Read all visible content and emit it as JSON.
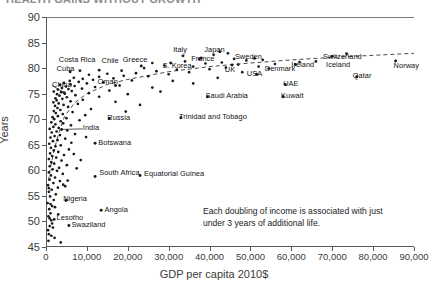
{
  "title": "HEALTH GAINS WITHOUT GROWTH",
  "annotation": "Each doubling of income is associated with just under 3 years of additional life.",
  "axes": {
    "y_title": "Years",
    "x_title": "GDP per capita 2010$",
    "y_ticks": [
      "45",
      "50",
      "55",
      "60",
      "65",
      "70",
      "75",
      "80",
      "85",
      "90"
    ],
    "x_ticks": [
      "0",
      "10,000",
      "20,000",
      "30,000",
      "40,000",
      "50,000",
      "60,000",
      "70,000",
      "80,000",
      "90,000"
    ]
  },
  "chart_data": {
    "type": "scatter",
    "title": "HEALTH GAINS WITHOUT GROWTH",
    "xlabel": "GDP per capita 2010$",
    "ylabel": "Years",
    "xlim": [
      0,
      90000
    ],
    "ylim": [
      45,
      90
    ],
    "x_tick_step": 10000,
    "y_tick_step": 5,
    "grid": false,
    "legend": false,
    "trendline": {
      "type": "logarithmic",
      "style": "dashed",
      "color": "#333333",
      "note": "Each doubling of income is associated with just under 3 years of additional life.",
      "points": [
        [
          600,
          58.0
        ],
        [
          1200,
          61.0
        ],
        [
          2000,
          64.0
        ],
        [
          3000,
          67.0
        ],
        [
          4500,
          70.5
        ],
        [
          7000,
          73.2
        ],
        [
          10000,
          75.0
        ],
        [
          15000,
          76.8
        ],
        [
          20000,
          77.8
        ],
        [
          30000,
          79.3
        ],
        [
          40000,
          80.3
        ],
        [
          50000,
          81.0
        ],
        [
          60000,
          81.6
        ],
        [
          70000,
          82.1
        ],
        [
          80000,
          82.5
        ],
        [
          90000,
          82.9
        ]
      ]
    },
    "labeled_points": [
      {
        "name": "China",
        "x": 4400,
        "y": 75.2,
        "label_x": 1500,
        "label_y": 76.6,
        "anchor": "left",
        "leader": true
      },
      {
        "name": "Cuba",
        "x": 5900,
        "y": 79.3,
        "label_x": 2600,
        "label_y": 79.6,
        "anchor": "left"
      },
      {
        "name": "Costa Rica",
        "x": 8300,
        "y": 79.5,
        "label_x": 7600,
        "label_y": 81.4,
        "anchor": "center"
      },
      {
        "name": "Chile",
        "x": 13000,
        "y": 79.6,
        "label_x": 13600,
        "label_y": 81.3,
        "anchor": "left"
      },
      {
        "name": "Oman",
        "x": 17000,
        "y": 76.6,
        "label_x": 12600,
        "label_y": 77.0,
        "anchor": "left"
      },
      {
        "name": "Greece",
        "x": 23300,
        "y": 80.4,
        "label_x": 21800,
        "label_y": 81.4,
        "anchor": "center"
      },
      {
        "name": "S. Korea",
        "x": 30500,
        "y": 81.0,
        "label_x": 28500,
        "label_y": 80.2,
        "anchor": "left"
      },
      {
        "name": "Italy",
        "x": 33500,
        "y": 82.4,
        "label_x": 32800,
        "label_y": 83.4,
        "anchor": "center"
      },
      {
        "name": "France",
        "x": 37500,
        "y": 81.8,
        "label_x": 35500,
        "label_y": 81.6,
        "anchor": "left"
      },
      {
        "name": "Japan",
        "x": 42500,
        "y": 83.2,
        "label_x": 41200,
        "label_y": 83.4,
        "anchor": "center"
      },
      {
        "name": "UK",
        "x": 45500,
        "y": 80.6,
        "label_x": 45000,
        "label_y": 79.5,
        "anchor": "center"
      },
      {
        "name": "Sweden",
        "x": 51000,
        "y": 81.9,
        "label_x": 49500,
        "label_y": 81.9,
        "anchor": "center"
      },
      {
        "name": "Denmark",
        "x": 54500,
        "y": 79.9,
        "label_x": 53500,
        "label_y": 79.7,
        "anchor": "left"
      },
      {
        "name": "USA",
        "x": 51500,
        "y": 78.8,
        "label_x": 51000,
        "label_y": 78.6,
        "anchor": "center"
      },
      {
        "name": "Ireland",
        "x": 61000,
        "y": 80.7,
        "label_x": 60000,
        "label_y": 80.5,
        "anchor": "left"
      },
      {
        "name": "Switzerland",
        "x": 73500,
        "y": 82.8,
        "label_x": 72500,
        "label_y": 81.9,
        "anchor": "center"
      },
      {
        "name": "Iceland",
        "x": 70000,
        "y": 82.3,
        "label_x": 68500,
        "label_y": 80.5,
        "anchor": "left"
      },
      {
        "name": "Norway",
        "x": 85500,
        "y": 81.4,
        "label_x": 85000,
        "label_y": 80.3,
        "anchor": "left"
      },
      {
        "name": "Qatar",
        "x": 76000,
        "y": 78.3,
        "label_x": 75000,
        "label_y": 78.2,
        "anchor": "left"
      },
      {
        "name": "UAE",
        "x": 58500,
        "y": 76.8,
        "label_x": 58000,
        "label_y": 76.7,
        "anchor": "left"
      },
      {
        "name": "Kuwait",
        "x": 58000,
        "y": 74.4,
        "label_x": 57500,
        "label_y": 74.3,
        "anchor": "left"
      },
      {
        "name": "Saudi Arabia",
        "x": 39500,
        "y": 74.4,
        "label_x": 39000,
        "label_y": 74.3,
        "anchor": "left"
      },
      {
        "name": "Trinidad and Tobago",
        "x": 33000,
        "y": 70.3,
        "label_x": 32500,
        "label_y": 70.2,
        "anchor": "left"
      },
      {
        "name": "Russia",
        "x": 15500,
        "y": 70.1,
        "label_x": 15000,
        "label_y": 70.0,
        "anchor": "left"
      },
      {
        "name": "India",
        "x": 3800,
        "y": 68.0,
        "label_x": 9000,
        "label_y": 68.1,
        "anchor": "left",
        "leader": true
      },
      {
        "name": "Botswana",
        "x": 12000,
        "y": 65.3,
        "label_x": 12800,
        "label_y": 65.2,
        "anchor": "left"
      },
      {
        "name": "South Africa",
        "x": 12000,
        "y": 58.8,
        "label_x": 13000,
        "label_y": 59.2,
        "anchor": "left"
      },
      {
        "name": "Equatorial Guinea",
        "x": 23000,
        "y": 59.0,
        "label_x": 24000,
        "label_y": 59.0,
        "anchor": "left"
      },
      {
        "name": "Nigeria",
        "x": 4900,
        "y": 54.1,
        "label_x": 4200,
        "label_y": 54.3,
        "anchor": "left"
      },
      {
        "name": "Angola",
        "x": 13500,
        "y": 52.2,
        "label_x": 14300,
        "label_y": 52.1,
        "anchor": "left"
      },
      {
        "name": "Lesotho",
        "x": 2000,
        "y": 50.4,
        "label_x": 2600,
        "label_y": 50.4,
        "anchor": "left"
      },
      {
        "name": "Swaziland",
        "x": 5600,
        "y": 49.2,
        "label_x": 6200,
        "label_y": 49.2,
        "anchor": "left"
      }
    ],
    "unlabeled_points": [
      [
        700,
        47.5
      ],
      [
        500,
        48.3
      ],
      [
        900,
        49.1
      ],
      [
        1300,
        50.2
      ],
      [
        600,
        51.0
      ],
      [
        1100,
        51.6
      ],
      [
        800,
        52.4
      ],
      [
        1500,
        53.0
      ],
      [
        400,
        53.6
      ],
      [
        1900,
        54.2
      ],
      [
        1000,
        54.9
      ],
      [
        2400,
        55.3
      ],
      [
        700,
        55.8
      ],
      [
        1400,
        56.2
      ],
      [
        2900,
        56.6
      ],
      [
        500,
        57.1
      ],
      [
        1800,
        57.5
      ],
      [
        3400,
        57.9
      ],
      [
        900,
        58.2
      ],
      [
        2200,
        58.6
      ],
      [
        1200,
        59.0
      ],
      [
        4100,
        59.3
      ],
      [
        700,
        59.6
      ],
      [
        2700,
        59.9
      ],
      [
        1600,
        60.2
      ],
      [
        3200,
        60.5
      ],
      [
        900,
        60.8
      ],
      [
        5100,
        61.0
      ],
      [
        2000,
        61.3
      ],
      [
        1300,
        61.6
      ],
      [
        3800,
        61.9
      ],
      [
        700,
        62.2
      ],
      [
        2500,
        62.5
      ],
      [
        1500,
        62.8
      ],
      [
        4400,
        63.0
      ],
      [
        1000,
        63.3
      ],
      [
        3000,
        63.6
      ],
      [
        1900,
        63.9
      ],
      [
        5600,
        64.1
      ],
      [
        1200,
        64.4
      ],
      [
        2300,
        64.7
      ],
      [
        3600,
        64.9
      ],
      [
        800,
        65.2
      ],
      [
        6200,
        65.4
      ],
      [
        1700,
        65.7
      ],
      [
        2800,
        65.9
      ],
      [
        4700,
        66.2
      ],
      [
        1100,
        66.4
      ],
      [
        2100,
        66.7
      ],
      [
        3400,
        66.9
      ],
      [
        7100,
        67.1
      ],
      [
        1400,
        67.4
      ],
      [
        2600,
        67.6
      ],
      [
        5200,
        67.8
      ],
      [
        900,
        68.1
      ],
      [
        3100,
        68.3
      ],
      [
        1800,
        68.5
      ],
      [
        6100,
        68.8
      ],
      [
        2300,
        69.0
      ],
      [
        4200,
        69.2
      ],
      [
        1300,
        69.4
      ],
      [
        3600,
        69.6
      ],
      [
        8200,
        69.8
      ],
      [
        2000,
        70.0
      ],
      [
        5000,
        70.2
      ],
      [
        1600,
        70.4
      ],
      [
        2900,
        70.6
      ],
      [
        9600,
        70.8
      ],
      [
        4100,
        71.0
      ],
      [
        2400,
        71.2
      ],
      [
        6500,
        71.4
      ],
      [
        1900,
        71.6
      ],
      [
        3500,
        71.8
      ],
      [
        11000,
        72.0
      ],
      [
        2800,
        72.2
      ],
      [
        5400,
        72.4
      ],
      [
        2200,
        72.6
      ],
      [
        4300,
        72.8
      ],
      [
        7800,
        73.0
      ],
      [
        3100,
        73.1
      ],
      [
        1800,
        73.3
      ],
      [
        6000,
        73.5
      ],
      [
        2600,
        73.7
      ],
      [
        9000,
        73.8
      ],
      [
        4000,
        74.0
      ],
      [
        2300,
        74.1
      ],
      [
        5100,
        74.3
      ],
      [
        13000,
        74.4
      ],
      [
        3300,
        74.6
      ],
      [
        7200,
        74.7
      ],
      [
        2700,
        74.9
      ],
      [
        4600,
        75.0
      ],
      [
        10500,
        75.1
      ],
      [
        3700,
        75.3
      ],
      [
        1900,
        75.4
      ],
      [
        6300,
        75.5
      ],
      [
        15500,
        75.6
      ],
      [
        2900,
        75.8
      ],
      [
        5500,
        75.9
      ],
      [
        8800,
        76.0
      ],
      [
        3900,
        76.1
      ],
      [
        12000,
        76.3
      ],
      [
        4900,
        76.4
      ],
      [
        7000,
        76.5
      ],
      [
        18000,
        76.6
      ],
      [
        3400,
        76.7
      ],
      [
        6000,
        76.8
      ],
      [
        10000,
        77.0
      ],
      [
        4400,
        77.1
      ],
      [
        14000,
        77.2
      ],
      [
        8000,
        77.3
      ],
      [
        5800,
        77.5
      ],
      [
        21000,
        77.6
      ],
      [
        11500,
        77.7
      ],
      [
        9000,
        77.9
      ],
      [
        16500,
        78.0
      ],
      [
        6800,
        78.1
      ],
      [
        13000,
        78.3
      ],
      [
        25000,
        78.4
      ],
      [
        19000,
        78.5
      ],
      [
        10500,
        78.7
      ],
      [
        30000,
        78.8
      ],
      [
        15000,
        78.9
      ],
      [
        22000,
        79.0
      ],
      [
        35000,
        79.2
      ],
      [
        27000,
        79.4
      ],
      [
        18500,
        79.5
      ],
      [
        32000,
        79.7
      ],
      [
        40000,
        79.8
      ],
      [
        24000,
        80.0
      ],
      [
        44000,
        80.1
      ],
      [
        36000,
        80.3
      ],
      [
        29000,
        80.5
      ],
      [
        47000,
        80.7
      ],
      [
        39000,
        80.9
      ],
      [
        43000,
        81.1
      ],
      [
        34000,
        81.3
      ],
      [
        49000,
        81.5
      ],
      [
        26000,
        81.0
      ],
      [
        46000,
        81.8
      ],
      [
        38000,
        82.0
      ],
      [
        41000,
        82.6
      ],
      [
        44500,
        82.9
      ],
      [
        3600,
        45.9
      ],
      [
        2100,
        46.8
      ],
      [
        1300,
        47.2
      ],
      [
        600,
        46.2
      ],
      [
        1700,
        48.8
      ],
      [
        900,
        50.6
      ],
      [
        2200,
        52.8
      ],
      [
        1500,
        49.6
      ],
      [
        3000,
        51.4
      ],
      [
        700,
        56.5
      ],
      [
        4700,
        56.9
      ],
      [
        1100,
        53.4
      ],
      [
        8500,
        62.0
      ],
      [
        6800,
        63.2
      ],
      [
        5300,
        58.0
      ],
      [
        9800,
        66.5
      ],
      [
        7500,
        60.4
      ],
      [
        4200,
        57.2
      ],
      [
        20000,
        74.9
      ],
      [
        17000,
        73.4
      ],
      [
        26000,
        76.2
      ],
      [
        31000,
        77.5
      ],
      [
        28000,
        75.4
      ],
      [
        23000,
        72.8
      ],
      [
        19500,
        71.5
      ],
      [
        36000,
        77.0
      ],
      [
        42000,
        78.1
      ],
      [
        48000,
        79.2
      ],
      [
        52000,
        80.3
      ],
      [
        56000,
        80.8
      ],
      [
        62000,
        81.2
      ],
      [
        66000,
        81.3
      ],
      [
        53000,
        81.6
      ]
    ]
  }
}
